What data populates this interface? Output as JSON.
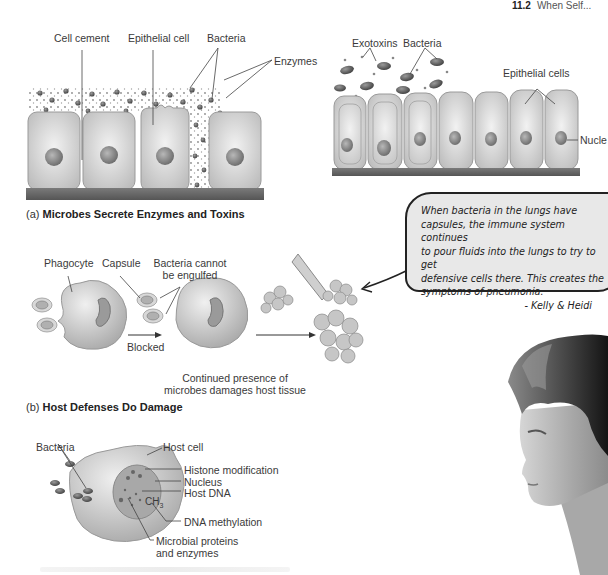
{
  "header": {
    "section_number": "11.2",
    "section_title": "When Self..."
  },
  "panel_a": {
    "left_labels": {
      "cell_cement": "Cell cement",
      "epithelial_cell": "Epithelial cell",
      "bacteria": "Bacteria",
      "enzymes": "Enzymes"
    },
    "right_labels": {
      "exotoxins": "Exotoxins",
      "bacteria": "Bacteria",
      "epithelial_cells": "Epithelial cells",
      "nucleus": "Nucle"
    },
    "caption_prefix": "(a)",
    "caption_title": "Microbes Secrete Enzymes and Toxins"
  },
  "panel_b": {
    "labels": {
      "phagocyte": "Phagocyte",
      "capsule": "Capsule",
      "bacteria_cannot_1": "Bacteria cannot",
      "bacteria_cannot_2": "be engulfed",
      "blocked": "Blocked",
      "continued_1": "Continued presence of",
      "continued_2": "microbes damages host tissue"
    },
    "caption_prefix": "(b)",
    "caption_title": "Host Defenses Do Damage"
  },
  "speech_bubble": {
    "lines": [
      "When bacteria in the lungs have",
      "capsules, the immune system continues",
      "to pour fluids into the lungs to try to get",
      "defensive cells there. This creates the",
      "symptoms of pneumonia."
    ],
    "signature": "- Kelly & Heidi"
  },
  "panel_c": {
    "labels": {
      "bacteria": "Bacteria",
      "host_cell": "Host cell",
      "histone_modification": "Histone modification",
      "nucleus": "Nucleus",
      "host_dna": "Host DNA",
      "ch3": "CH",
      "ch3_sub": "3",
      "dna_methylation": "DNA methylation",
      "microbial_1": "Microbial proteins",
      "microbial_2": "and enzymes"
    }
  }
}
